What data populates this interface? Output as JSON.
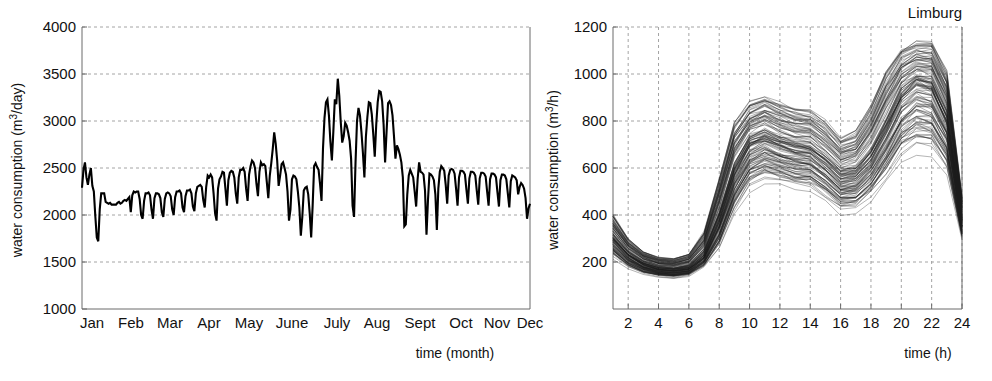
{
  "figure": {
    "background": "#ffffff",
    "ink": "#000000",
    "grid_color": "#9a9a9a",
    "axis_color": "#6b6b6b"
  },
  "chart_data": [
    {
      "id": "daily-water-consumption",
      "type": "line",
      "title": "",
      "xlabel": "time (month)",
      "ylabel": "water consumption (m3/day)",
      "ylabel_parts": {
        "pre": "water consumption (m",
        "sup": "3",
        "post": "/day)"
      },
      "grid": "horizontal",
      "legend": "none",
      "ylim": [
        1000,
        4000
      ],
      "yticks": [
        1000,
        1500,
        2000,
        2500,
        3000,
        3500,
        4000
      ],
      "ytick_labels": [
        "1000",
        "1500",
        "2000",
        "2500",
        "3000",
        "3500",
        "4000"
      ],
      "categories": [
        "Jan",
        "Feb",
        "Mar",
        "Apr",
        "May",
        "June",
        "July",
        "Aug",
        "Sept",
        "Oct",
        "Nov",
        "Dec"
      ],
      "xtick_labels": [
        "Jan",
        "Feb",
        "Mar",
        "Apr",
        "May",
        "June",
        "July",
        "Aug",
        "Sept",
        "Oct",
        "Nov",
        "Dec"
      ],
      "x": [
        1,
        2,
        3,
        4,
        5,
        6,
        7,
        8,
        9,
        10,
        11,
        12,
        13,
        14,
        15,
        16,
        17,
        18,
        19,
        20,
        21,
        22,
        23,
        24,
        25,
        26,
        27,
        28,
        29,
        30,
        31,
        32,
        33,
        34,
        35,
        36,
        37,
        38,
        39,
        40,
        41,
        42,
        43,
        44,
        45,
        46,
        47,
        48,
        49,
        50,
        51,
        52,
        53,
        54,
        55,
        56,
        57,
        58,
        59,
        60,
        61,
        62,
        63,
        64,
        65,
        66,
        67,
        68,
        69,
        70,
        71,
        72,
        73,
        74,
        75,
        76,
        77,
        78,
        79,
        80,
        81,
        82,
        83,
        84,
        85,
        86,
        87,
        88,
        89,
        90,
        91,
        92,
        93,
        94,
        95,
        96,
        97,
        98,
        99,
        100,
        101,
        102,
        103,
        104,
        105,
        106,
        107,
        108,
        109,
        110,
        111,
        112,
        113,
        114,
        115,
        116,
        117,
        118,
        119,
        120,
        121,
        122,
        123,
        124,
        125,
        126,
        127,
        128,
        129,
        130,
        131,
        132,
        133,
        134,
        135,
        136,
        137,
        138,
        139,
        140,
        141,
        142,
        143,
        144,
        145,
        146,
        147,
        148,
        149,
        150,
        151,
        152,
        153,
        154,
        155,
        156,
        157,
        158,
        159,
        160,
        161,
        162,
        163,
        164,
        165,
        166,
        167,
        168,
        169,
        170,
        171,
        172,
        173,
        174,
        175,
        176,
        177,
        178,
        179,
        180,
        181,
        182,
        183,
        184,
        185,
        186,
        187,
        188,
        189,
        190,
        191,
        192,
        193,
        194,
        195,
        196,
        197,
        198,
        199,
        200,
        201,
        202,
        203,
        204,
        205,
        206,
        207,
        208,
        209,
        210,
        211,
        212,
        213,
        214,
        215,
        216,
        217,
        218,
        219,
        220,
        221,
        222,
        223,
        224,
        225,
        226,
        227,
        228,
        229,
        230,
        231,
        232,
        233,
        234,
        235,
        236,
        237,
        238,
        239,
        240,
        241,
        242,
        243,
        244,
        245,
        246,
        247,
        248,
        249,
        250,
        251,
        252,
        253,
        254,
        255,
        256,
        257,
        258,
        259,
        260,
        261,
        262,
        263,
        264,
        265
      ],
      "values": [
        2290,
        2480,
        2560,
        2400,
        2320,
        2430,
        2500,
        2310,
        2250,
        1990,
        1760,
        1720,
        2060,
        2230,
        2230,
        2230,
        2140,
        2130,
        2120,
        2130,
        2110,
        2110,
        2110,
        2110,
        2130,
        2140,
        2120,
        2130,
        2150,
        2160,
        2150,
        2170,
        2190,
        2030,
        2210,
        2250,
        2240,
        2250,
        2250,
        2170,
        2000,
        1960,
        2150,
        2230,
        2230,
        2240,
        2210,
        2060,
        1960,
        2180,
        2230,
        2230,
        2220,
        2180,
        2030,
        1980,
        2170,
        2230,
        2240,
        2230,
        2200,
        2060,
        2000,
        2190,
        2250,
        2250,
        2260,
        2230,
        2080,
        2030,
        2200,
        2260,
        2260,
        2270,
        2230,
        2090,
        2040,
        2230,
        2300,
        2310,
        2320,
        2300,
        2160,
        2080,
        2300,
        2420,
        2400,
        2430,
        2400,
        2230,
        2020,
        1940,
        2280,
        2380,
        2410,
        2460,
        2450,
        2280,
        2100,
        2370,
        2450,
        2470,
        2460,
        2400,
        2230,
        2120,
        2400,
        2480,
        2480,
        2500,
        2460,
        2280,
        2150,
        2430,
        2520,
        2580,
        2560,
        2500,
        2330,
        2200,
        2460,
        2560,
        2530,
        2540,
        2520,
        2350,
        2180,
        2420,
        2550,
        2700,
        2880,
        2760,
        2580,
        2310,
        2420,
        2540,
        2560,
        2500,
        2430,
        2250,
        1940,
        2060,
        2380,
        2420,
        2410,
        2380,
        2250,
        2080,
        1780,
        1980,
        2260,
        2290,
        2300,
        2220,
        2020,
        1760,
        2100,
        2520,
        2550,
        2510,
        2480,
        2330,
        2150,
        2710,
        3030,
        3200,
        3230,
        3060,
        2780,
        2580,
        2890,
        3230,
        3180,
        3450,
        3270,
        2990,
        2770,
        2840,
        2980,
        2950,
        2880,
        2790,
        2600,
        2100,
        1980,
        2560,
        3000,
        3140,
        3060,
        2880,
        2660,
        2400,
        2830,
        3040,
        3200,
        3190,
        3070,
        2860,
        2620,
        2960,
        3200,
        3320,
        3310,
        3210,
        2960,
        2560,
        2890,
        3190,
        3210,
        3170,
        3060,
        2840,
        2600,
        2740,
        2700,
        2640,
        2560,
        2400,
        1880,
        1900,
        2220,
        2420,
        2480,
        2440,
        2400,
        2250,
        2090,
        2380,
        2560,
        2460,
        2450,
        2430,
        2260,
        1790,
        2160,
        2440,
        2430,
        2410,
        2370,
        2220,
        1840,
        2280,
        2460,
        2520,
        2500,
        2470,
        2320,
        2120,
        2420,
        2480,
        2490,
        2480,
        2440,
        2280,
        2100,
        2400,
        2470,
        2470,
        2460,
        2430,
        2270,
        2120,
        2390,
        2460,
        2460,
        2450,
        2420,
        2260,
        2110,
        2390,
        2450,
        2450,
        2440,
        2410,
        2250,
        2100,
        2380,
        2440,
        2440,
        2430,
        2400,
        2240,
        2090,
        2370,
        2430,
        2430,
        2420,
        2380,
        2230,
        2080,
        2360,
        2420,
        2410,
        2400,
        2370,
        2220,
        2300,
        2340,
        2320,
        2280,
        2180,
        1960,
        2070,
        2120
      ]
    },
    {
      "id": "hourly-water-consumption-limburg",
      "type": "line",
      "title": "Limburg",
      "xlabel": "time (h)",
      "ylabel": "water consumption (m3/h)",
      "ylabel_parts": {
        "pre": "water consumption (m",
        "sup": "3",
        "post": "/h)"
      },
      "grid": "both",
      "legend": "none",
      "series_count": 120,
      "ylim": [
        0,
        1200
      ],
      "yticks": [
        200,
        400,
        600,
        800,
        1000,
        1200
      ],
      "ytick_labels": [
        "200",
        "400",
        "600",
        "800",
        "1000",
        "1200"
      ],
      "xlim": [
        1,
        24
      ],
      "xticks": [
        2,
        4,
        6,
        8,
        10,
        12,
        14,
        16,
        18,
        20,
        22,
        24
      ],
      "xtick_labels": [
        "2",
        "4",
        "6",
        "8",
        "10",
        "12",
        "14",
        "16",
        "18",
        "20",
        "22",
        "24"
      ],
      "x": [
        1,
        2,
        3,
        4,
        5,
        6,
        7,
        8,
        9,
        10,
        11,
        12,
        13,
        14,
        15,
        16,
        17,
        18,
        19,
        20,
        21,
        22,
        23,
        24
      ],
      "profile_mean": [
        300,
        230,
        190,
        170,
        165,
        175,
        230,
        380,
        580,
        700,
        730,
        700,
        680,
        670,
        620,
        560,
        570,
        640,
        760,
        900,
        960,
        940,
        800,
        380
      ],
      "profile_upper": [
        400,
        300,
        245,
        220,
        215,
        235,
        330,
        560,
        800,
        880,
        910,
        880,
        855,
        845,
        800,
        730,
        760,
        870,
        1020,
        1110,
        1140,
        1140,
        1010,
        480
      ],
      "profile_lower": [
        215,
        170,
        145,
        135,
        130,
        140,
        175,
        250,
        400,
        500,
        530,
        520,
        500,
        495,
        455,
        405,
        410,
        460,
        540,
        620,
        660,
        650,
        560,
        290
      ]
    }
  ]
}
